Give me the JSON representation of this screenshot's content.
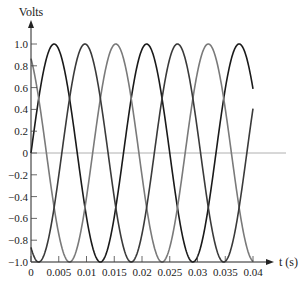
{
  "chart_data": {
    "type": "line",
    "title": "",
    "xlabel": "t (s)",
    "ylabel": "Volts",
    "xlim": [
      0,
      0.04
    ],
    "ylim": [
      -1.0,
      1.0
    ],
    "grid": false,
    "legend": null,
    "x_ticks": [
      "0",
      "0.005",
      "0.01",
      "0.015",
      "0.02",
      "0.025",
      "0.03",
      "0.035",
      "0.04"
    ],
    "y_ticks": [
      "1.0",
      "0.8",
      "0.6",
      "0.4",
      "0.2",
      "0",
      "-0.2",
      "-0.4",
      "-0.6",
      "-0.8",
      "-1.0"
    ],
    "frequency_hz": 60,
    "series": [
      {
        "name": "phase-a",
        "formula": "sin(2*pi*60*t)",
        "phase_deg": 0,
        "color": "#1a1a1a"
      },
      {
        "name": "phase-b",
        "formula": "sin(2*pi*60*t + 120deg)",
        "phase_deg": 120,
        "color": "#7a7a7a"
      },
      {
        "name": "phase-c",
        "formula": "sin(2*pi*60*t - 120deg)",
        "phase_deg": -120,
        "color": "#3a3a3a"
      }
    ],
    "zero_line_color": "#b0b0b0"
  }
}
